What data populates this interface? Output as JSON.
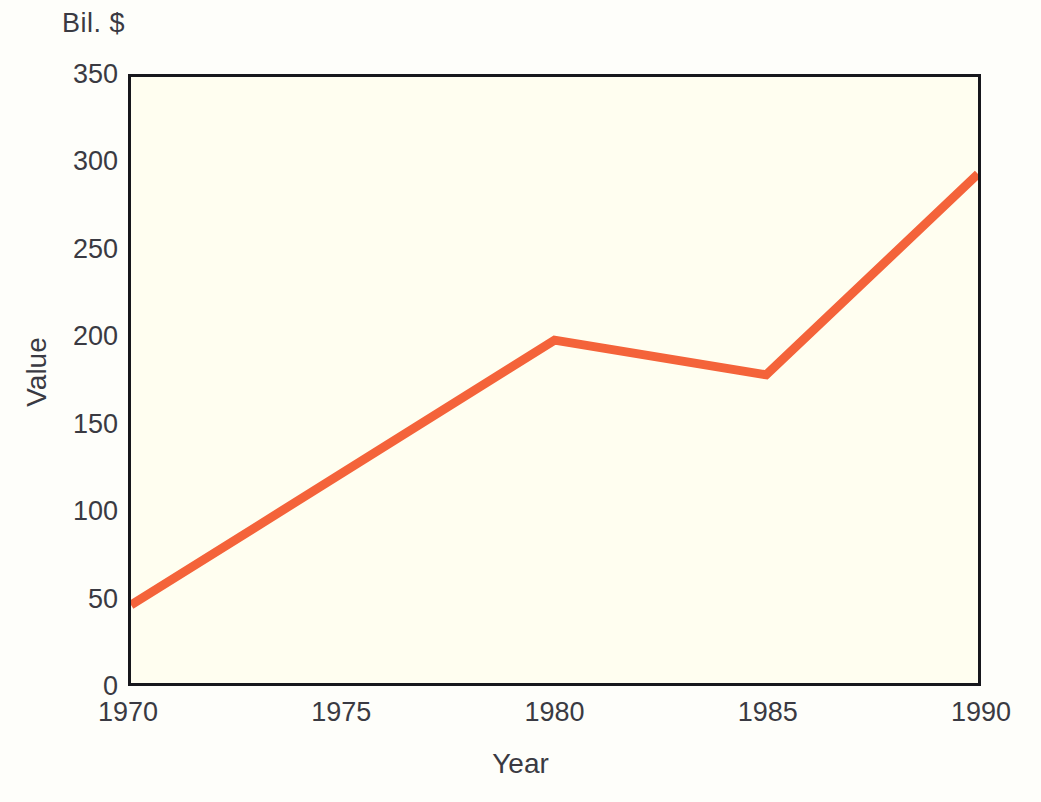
{
  "chart_data": {
    "type": "line",
    "title": "",
    "unit_label": "Bil. $",
    "xlabel": "Year",
    "ylabel": "Value",
    "x": [
      1970,
      1980,
      1985,
      1990
    ],
    "values": [
      45,
      198,
      178,
      294
    ],
    "series": [
      {
        "name": "Value",
        "color": "#F4633A",
        "points": [
          {
            "x": 1970,
            "y": 45
          },
          {
            "x": 1980,
            "y": 198
          },
          {
            "x": 1985,
            "y": 178
          },
          {
            "x": 1990,
            "y": 294
          }
        ]
      }
    ],
    "xlim": [
      1970,
      1990
    ],
    "ylim": [
      0,
      350
    ],
    "x_ticks": [
      1970,
      1975,
      1980,
      1985,
      1990
    ],
    "x_tick_labels": [
      "1970",
      "1975",
      "1980",
      "1985",
      "1990"
    ],
    "y_ticks": [
      0,
      50,
      100,
      150,
      200,
      250,
      300,
      350
    ],
    "y_tick_labels": [
      "0",
      "50",
      "100",
      "150",
      "200",
      "250",
      "300",
      "350"
    ],
    "grid": false,
    "legend": "none",
    "plot_background": "#FFFEF0",
    "frame_color": "#17171C",
    "text_color": "#3A3A42",
    "line_width": 9
  }
}
